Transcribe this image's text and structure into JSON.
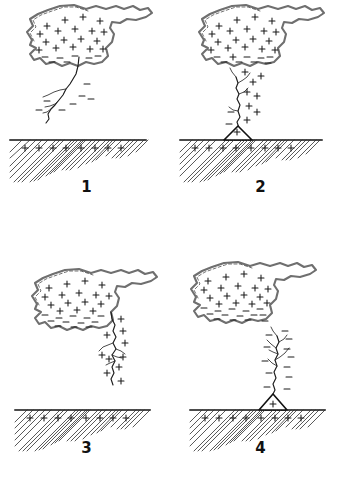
{
  "figure": {
    "background_color": "#ffffff",
    "ink_color": "#1a1a1a",
    "cloud_outline_color": "#6f6f6f",
    "width": 347,
    "height": 478
  },
  "panels": [
    {
      "id": "panel-1",
      "label": "1",
      "caption": "Stepped leader descends from negatively charged cloud base",
      "cloud": {
        "positive_charge_count": 18,
        "negative_charge_count": 7,
        "charge_top_sign": "+",
        "charge_bottom_sign": "-"
      },
      "bolt": {
        "type": "stepped-leader",
        "direction": "downward",
        "reaches_ground": false,
        "branch_count": 3,
        "charge_marks_sign": "-",
        "charge_marks_count": 7
      },
      "ground": {
        "x": 10,
        "width": 136,
        "top_y": 140,
        "charge_sign": "+",
        "charge_count": 8,
        "has_cone": false
      }
    },
    {
      "id": "panel-2",
      "label": "2",
      "caption": "Leader meets upward streamer; return stroke channel to ground",
      "cloud": {
        "positive_charge_count": 18,
        "negative_charge_count": 8,
        "charge_top_sign": "+",
        "charge_bottom_sign": "-"
      },
      "bolt": {
        "type": "return-stroke",
        "direction": "downward",
        "reaches_ground": true,
        "branch_count": 4,
        "charge_marks_sign": "+",
        "charge_marks_count": 9
      },
      "ground": {
        "x": 6,
        "width": 142,
        "top_y": 140,
        "charge_sign": "+",
        "charge_count": 8,
        "has_cone": true,
        "cone_x": 44,
        "cone_width": 26,
        "cone_height": 14
      }
    },
    {
      "id": "panel-3",
      "label": "3",
      "caption": "Subsequent dart leader follows the ionised channel downward",
      "cloud": {
        "positive_charge_count": 16,
        "negative_charge_count": 12,
        "charge_top_sign": "+",
        "charge_bottom_sign": "-"
      },
      "bolt": {
        "type": "dart-leader",
        "direction": "downward",
        "reaches_ground": false,
        "branch_count": 4,
        "charge_marks_sign": "+",
        "charge_marks_count": 10
      },
      "ground": {
        "x": 15,
        "width": 135,
        "top_y": 171,
        "charge_sign": "+",
        "charge_count": 8,
        "has_cone": false
      }
    },
    {
      "id": "panel-4",
      "label": "4",
      "caption": "Second return stroke propagates upward from the ground",
      "cloud": {
        "positive_charge_count": 17,
        "negative_charge_count": 14,
        "charge_top_sign": "+",
        "charge_bottom_sign": "-"
      },
      "bolt": {
        "type": "return-stroke-upward",
        "direction": "upward",
        "reaches_ground": true,
        "branch_count": 6,
        "charge_marks_sign": "-",
        "charge_marks_count": 12
      },
      "ground": {
        "x": 16,
        "width": 135,
        "top_y": 171,
        "charge_sign": "+",
        "charge_count": 8,
        "has_cone": true,
        "cone_x": 74,
        "cone_width": 28,
        "cone_height": 16
      }
    }
  ]
}
